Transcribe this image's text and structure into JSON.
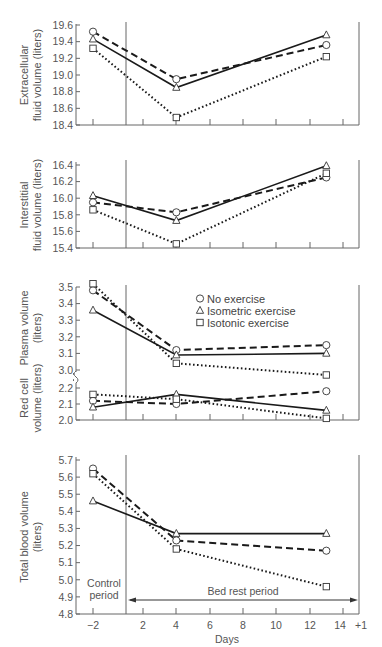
{
  "chart_data": [
    {
      "type": "line",
      "panel": "extracellular",
      "ylabel": [
        "Extracellular",
        "fluid volume (liters)"
      ],
      "ylim": [
        18.4,
        19.6
      ],
      "yticks": [
        18.4,
        18.6,
        18.8,
        19.0,
        19.2,
        19.4,
        19.6
      ],
      "ytick_labels": [
        "18.4",
        "18.6",
        "18.8",
        "19.0",
        "19.2",
        "19.4",
        "19.6"
      ],
      "x": [
        -2,
        4,
        13
      ],
      "series": [
        {
          "name": "No exercise",
          "marker": "circle",
          "style": "dashed",
          "values": [
            19.52,
            18.95,
            19.36
          ]
        },
        {
          "name": "Isometric exercise",
          "marker": "triangle",
          "style": "solid",
          "values": [
            19.43,
            18.85,
            19.48
          ]
        },
        {
          "name": "Isotonic exercise",
          "marker": "square",
          "style": "dotted",
          "values": [
            19.32,
            18.49,
            19.22
          ]
        }
      ]
    },
    {
      "type": "line",
      "panel": "interstitial",
      "ylabel": [
        "Interstitial",
        "fluid volume (liters)"
      ],
      "ylim": [
        15.4,
        16.4
      ],
      "yticks": [
        15.4,
        15.6,
        15.8,
        16.0,
        16.2,
        16.4
      ],
      "ytick_labels": [
        "15.4",
        "15.6",
        "15.8",
        "16.0",
        "16.2",
        "16.4"
      ],
      "x": [
        -2,
        4,
        13
      ],
      "series": [
        {
          "name": "No exercise",
          "marker": "circle",
          "style": "dashed",
          "values": [
            15.95,
            15.83,
            16.25
          ]
        },
        {
          "name": "Isometric exercise",
          "marker": "triangle",
          "style": "solid",
          "values": [
            16.03,
            15.73,
            16.39
          ]
        },
        {
          "name": "Isotonic exercise",
          "marker": "square",
          "style": "dotted",
          "values": [
            15.86,
            15.45,
            16.3
          ]
        }
      ]
    },
    {
      "type": "line",
      "panel": "plasma",
      "ylabel": [
        "Plasma volume",
        "(liters)"
      ],
      "ylim": [
        3.0,
        3.5
      ],
      "yticks": [
        3.0,
        3.1,
        3.2,
        3.3,
        3.4,
        3.5
      ],
      "ytick_labels": [
        "3.0",
        "3.1",
        "3.2",
        "3.3",
        "3.4",
        "3.5"
      ],
      "x": [
        -2,
        4,
        13
      ],
      "series": [
        {
          "name": "No exercise",
          "marker": "circle",
          "style": "dashed",
          "values": [
            3.48,
            3.12,
            3.15
          ]
        },
        {
          "name": "Isometric exercise",
          "marker": "triangle",
          "style": "solid",
          "values": [
            3.36,
            3.09,
            3.1
          ]
        },
        {
          "name": "Isotonic exercise",
          "marker": "square",
          "style": "dotted",
          "values": [
            3.52,
            3.04,
            2.97
          ]
        }
      ]
    },
    {
      "type": "line",
      "panel": "red-cell",
      "ylabel": [
        "Red cell",
        "volume (liters)"
      ],
      "ylim": [
        2.0,
        2.2
      ],
      "yticks": [
        2.0,
        2.1,
        2.2
      ],
      "ytick_labels": [
        "2.0",
        "2.1",
        "2.2"
      ],
      "x": [
        -2,
        4,
        13
      ],
      "series": [
        {
          "name": "No exercise",
          "marker": "circle",
          "style": "dashed",
          "values": [
            2.12,
            2.1,
            2.18
          ]
        },
        {
          "name": "Isometric exercise",
          "marker": "triangle",
          "style": "solid",
          "values": [
            2.08,
            2.16,
            2.06
          ]
        },
        {
          "name": "Isotonic exercise",
          "marker": "square",
          "style": "dotted",
          "values": [
            2.16,
            2.13,
            2.01
          ]
        }
      ]
    },
    {
      "type": "line",
      "panel": "total-blood",
      "ylabel": [
        "Total blood volume",
        "(liters)"
      ],
      "ylim": [
        4.8,
        5.7
      ],
      "yticks": [
        4.8,
        4.9,
        5.0,
        5.1,
        5.2,
        5.3,
        5.4,
        5.5,
        5.6,
        5.7
      ],
      "ytick_labels": [
        "4.8",
        "4.9",
        "5.0",
        "5.1",
        "5.2",
        "5.3",
        "5.4",
        "5.5",
        "5.6",
        "5.7"
      ],
      "x": [
        -2,
        4,
        13
      ],
      "xlabel": "Days",
      "xtick_labels": [
        "−2",
        "2",
        "4",
        "6",
        "8",
        "10",
        "12",
        "14",
        "+1"
      ],
      "series": [
        {
          "name": "No exercise",
          "marker": "circle",
          "style": "dashed",
          "values": [
            5.65,
            5.23,
            5.17
          ]
        },
        {
          "name": "Isometric exercise",
          "marker": "triangle",
          "style": "solid",
          "values": [
            5.46,
            5.27,
            5.27
          ]
        },
        {
          "name": "Isotonic exercise",
          "marker": "square",
          "style": "dotted",
          "values": [
            5.62,
            5.18,
            4.96
          ]
        }
      ]
    }
  ],
  "legend": {
    "items": [
      {
        "label": "No exercise",
        "marker": "circle"
      },
      {
        "label": "Isometric exercise",
        "marker": "triangle"
      },
      {
        "label": "Isotonic exercise",
        "marker": "square"
      }
    ]
  },
  "annotations": {
    "control_line1": "Control",
    "control_line2": "period",
    "bed_rest": "Bed rest period"
  },
  "colors": {
    "line": "#1a1a1a",
    "axis": "#666666",
    "text": "#555555"
  }
}
